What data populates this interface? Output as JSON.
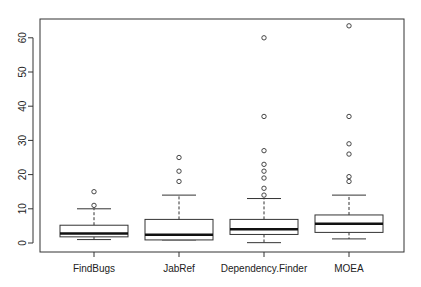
{
  "chart_data": {
    "type": "boxplot",
    "title": "",
    "xlabel": "",
    "ylabel": "",
    "ylim": [
      0,
      65
    ],
    "yticks": [
      0,
      10,
      20,
      30,
      40,
      50,
      60
    ],
    "grid": false,
    "legend": null,
    "categories": [
      "FindBugs",
      "JabRef",
      "Dependency.Finder",
      "MOEA"
    ],
    "series": [
      {
        "name": "FindBugs",
        "whisker_low": 1,
        "q1": 1.8,
        "median": 2.8,
        "q3": 5.2,
        "whisker_high": 10,
        "outliers": [
          11,
          15
        ]
      },
      {
        "name": "JabRef",
        "whisker_low": 0.9,
        "q1": 0.9,
        "median": 2.4,
        "q3": 6.9,
        "whisker_high": 14,
        "outliers": [
          18,
          21,
          25
        ]
      },
      {
        "name": "Dependency.Finder",
        "whisker_low": 0.1,
        "q1": 2.5,
        "median": 4,
        "q3": 6.9,
        "whisker_high": 13,
        "outliers": [
          14,
          16,
          19,
          21,
          23,
          27,
          37,
          60
        ]
      },
      {
        "name": "MOEA",
        "whisker_low": 1.2,
        "q1": 3.1,
        "median": 5.6,
        "q3": 8.2,
        "whisker_high": 14,
        "outliers": [
          18,
          19.4,
          26,
          29,
          37,
          63.5
        ]
      }
    ]
  }
}
